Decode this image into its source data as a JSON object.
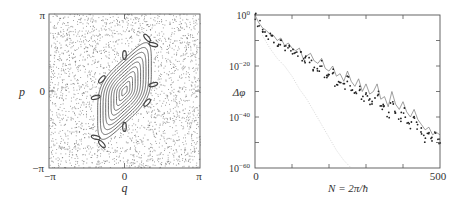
{
  "chart_data": [
    {
      "type": "scatter",
      "title": "",
      "xlabel": "q",
      "ylabel": "p",
      "xlim": [
        -3.14159,
        3.14159
      ],
      "ylim": [
        -3.14159,
        3.14159
      ],
      "x_tick_labels": [
        "−π",
        "0",
        "π"
      ],
      "y_tick_labels": [
        "π",
        "0",
        "−π"
      ],
      "grid": false,
      "legend": null,
      "description": "Phase-space (Poincaré) section: chaotic sea of scattered points surrounding a central regular island of nested closed curves tilted along the diagonal, bounded by a chain of small islands.",
      "regular_island": {
        "center": [
          0.0,
          0.0
        ],
        "num_nested_curves": 10,
        "outer_half_extent_q": 1.55,
        "outer_half_extent_p": 2.15,
        "shear": 0.9,
        "island_chain_count": 10
      },
      "chaotic_sea_points": 2600
    },
    {
      "type": "line",
      "title": "",
      "xlabel": "N = 2π/ħ",
      "ylabel": "Δφ",
      "xlim": [
        0,
        500
      ],
      "ylim_log10": [
        -60,
        0
      ],
      "yscale": "log",
      "x_tick_labels": [
        "0",
        "500"
      ],
      "x_ticks": [
        0,
        100,
        200,
        300,
        400,
        500
      ],
      "y_tick_labels": [
        "10^0",
        "10^-20",
        "10^-40",
        "10^-60"
      ],
      "y_ticks_log10": [
        0,
        -10,
        -20,
        -30,
        -40,
        -50,
        -60
      ],
      "grid": false,
      "legend": null,
      "series": [
        {
          "name": "exact splitting (thin line)",
          "style": "line",
          "x": [
            0,
            10,
            20,
            30,
            40,
            50,
            60,
            70,
            80,
            90,
            100,
            110,
            120,
            130,
            140,
            150,
            160,
            170,
            180,
            190,
            200,
            210,
            220,
            230,
            240,
            250,
            260,
            270,
            280,
            290,
            300,
            310,
            320,
            330,
            340,
            350,
            360,
            370,
            380,
            390,
            400,
            410,
            420,
            430,
            440,
            450,
            460,
            470,
            480,
            490,
            500
          ],
          "log10_values": [
            0,
            -3,
            -5,
            -6,
            -7.5,
            -8,
            -10,
            -9,
            -12,
            -11,
            -13,
            -14,
            -13,
            -17,
            -16,
            -15,
            -18,
            -19,
            -17,
            -21,
            -22,
            -20,
            -24,
            -23,
            -26,
            -22,
            -26,
            -28,
            -25,
            -30,
            -27,
            -31,
            -30,
            -27,
            -33,
            -32,
            -36,
            -30,
            -35,
            -37,
            -34,
            -38,
            -40,
            -37,
            -41,
            -43,
            -45,
            -44,
            -47,
            -46,
            -47
          ]
        },
        {
          "name": "semiclassical estimate (dots)",
          "style": "markers",
          "x": [
            0,
            10,
            20,
            30,
            40,
            50,
            60,
            70,
            80,
            90,
            100,
            110,
            120,
            130,
            140,
            150,
            160,
            170,
            180,
            190,
            200,
            210,
            220,
            230,
            240,
            250,
            260,
            270,
            280,
            290,
            300,
            310,
            320,
            330,
            340,
            350,
            360,
            370,
            380,
            390,
            400,
            410,
            420,
            430,
            440,
            450,
            460,
            470,
            480,
            490,
            500
          ],
          "log10_values": [
            -1,
            -4,
            -6,
            -8,
            -9,
            -10,
            -12,
            -11,
            -14,
            -13,
            -15,
            -16,
            -16,
            -19,
            -18,
            -18,
            -21,
            -22,
            -20,
            -24,
            -25,
            -23,
            -27,
            -26,
            -29,
            -26,
            -29,
            -31,
            -29,
            -33,
            -31,
            -35,
            -34,
            -31,
            -37,
            -36,
            -40,
            -35,
            -39,
            -41,
            -38,
            -42,
            -44,
            -41,
            -44,
            -46,
            -49,
            -47,
            -50,
            -48,
            -50
          ]
        },
        {
          "name": "faint dotted decay",
          "style": "faint-dotted",
          "x": [
            20,
            40,
            60,
            80,
            100,
            120,
            140,
            160,
            180,
            200,
            220,
            240,
            260
          ],
          "log10_values": [
            -8,
            -13,
            -17,
            -20,
            -24,
            -29,
            -33,
            -38,
            -43,
            -48,
            -53,
            -57,
            -60
          ]
        }
      ]
    }
  ],
  "panels": {
    "left": {
      "ylabel": "p",
      "xlabel": "q",
      "x_ticks": [
        "−π",
        "0",
        "π"
      ],
      "y_ticks": [
        "π",
        "0",
        "−π"
      ]
    },
    "right": {
      "ylabel": "Δφ",
      "xlabel": "N = 2π/ħ",
      "x_ticks": [
        "0",
        "500"
      ],
      "y_ticks": [
        "10",
        "0",
        "10",
        "−20",
        "10",
        "−40",
        "10",
        "−60"
      ]
    }
  },
  "colors": {
    "frame": "#555555",
    "text": "#333333",
    "points": "#555555",
    "curves": "#444444",
    "faint": "#cccccc"
  }
}
